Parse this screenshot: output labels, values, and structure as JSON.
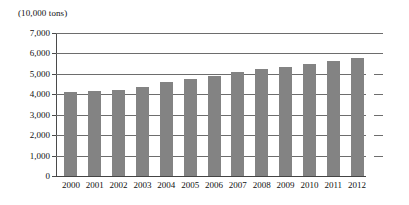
{
  "unit_label": "(10,000 tons)",
  "chart_data": {
    "type": "bar",
    "title": "",
    "subtitle": "",
    "xlabel": "",
    "ylabel": "(10,000 tons)",
    "categories": [
      "2000",
      "2001",
      "2002",
      "2003",
      "2004",
      "2005",
      "2006",
      "2007",
      "2008",
      "2009",
      "2010",
      "2011",
      "2012"
    ],
    "values": [
      4100,
      4150,
      4230,
      4350,
      4600,
      4750,
      4900,
      5100,
      5250,
      5350,
      5500,
      5650,
      5800
    ],
    "series": [
      {
        "name": "",
        "values": [
          4100,
          4150,
          4230,
          4350,
          4600,
          4750,
          4900,
          5100,
          5250,
          5350,
          5500,
          5650,
          5800
        ]
      }
    ],
    "ylim": [
      0,
      7000
    ],
    "yticks": [
      0,
      1000,
      2000,
      3000,
      4000,
      5000,
      6000,
      7000
    ],
    "ytick_labels": [
      "0",
      "1,000",
      "2,000",
      "3,000",
      "4,000",
      "5,000",
      "6,000",
      "7,000"
    ],
    "grid": true,
    "legend": false,
    "legend_position": "none",
    "bar_color": "#838383",
    "axis_color": "#4a4a4a",
    "gridline_color": "#6d6d6d",
    "background_color": "#ffffff"
  }
}
